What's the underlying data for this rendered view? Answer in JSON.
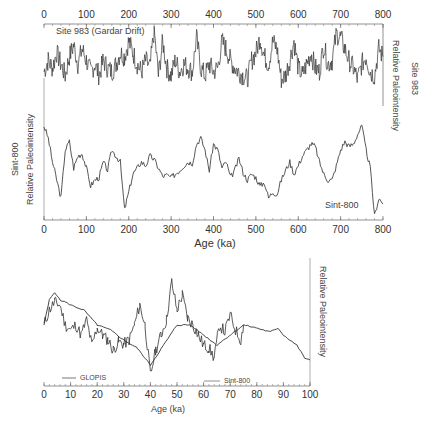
{
  "chart_data": [
    {
      "type": "line",
      "title": "Site 983 (Gardar Drift)",
      "xlabel": "Age (ka)",
      "top_axis": {
        "ticks": [
          0,
          100,
          200,
          300,
          400,
          500,
          600,
          700,
          800
        ],
        "labels": [
          "0",
          "100",
          "200",
          "300",
          "400",
          "500",
          "600",
          "700",
          "800"
        ]
      },
      "bottom_axis": {
        "ticks": [
          0,
          100,
          200,
          300,
          400,
          500,
          600,
          700,
          800
        ],
        "labels": [
          "0",
          "100",
          "200",
          "300",
          "400",
          "500",
          "600",
          "700",
          "800"
        ]
      },
      "xlim": [
        0,
        800
      ],
      "right_ylabel_1": "Relative Paleointensity",
      "right_ylabel_2": "Site 983",
      "left_ylabel_1": "Sint-800",
      "left_ylabel_2": "Relative Paleointensity",
      "grid": false,
      "series": [
        {
          "name": "Site 983",
          "note": "high-frequency relative paleointensity record, upper trace",
          "x": [
            0,
            10,
            20,
            30,
            40,
            50,
            60,
            70,
            80,
            90,
            100,
            110,
            120,
            130,
            140,
            150,
            160,
            170,
            180,
            190,
            200,
            210,
            220,
            230,
            240,
            250,
            260,
            270,
            280,
            290,
            300,
            310,
            320,
            330,
            340,
            350,
            360,
            370,
            380,
            390,
            400,
            410,
            420,
            430,
            440,
            450,
            460,
            470,
            480,
            490,
            500,
            510,
            520,
            530,
            540,
            550,
            560,
            570,
            580,
            590,
            600,
            610,
            620,
            630,
            640,
            650,
            660,
            670,
            680,
            690,
            700,
            710,
            720,
            730,
            740,
            750,
            760,
            770,
            780,
            790,
            800
          ],
          "y": [
            0.45,
            0.6,
            0.5,
            0.7,
            0.55,
            0.4,
            0.65,
            0.8,
            0.55,
            0.75,
            0.6,
            0.45,
            0.55,
            0.4,
            0.6,
            0.5,
            0.45,
            0.55,
            0.7,
            0.65,
            0.85,
            0.7,
            0.55,
            0.45,
            0.6,
            0.5,
            1.0,
            0.4,
            0.85,
            0.5,
            0.4,
            0.6,
            0.45,
            0.55,
            0.5,
            0.45,
            0.9,
            0.5,
            0.4,
            0.55,
            0.45,
            0.5,
            0.85,
            0.75,
            0.6,
            0.5,
            0.45,
            0.4,
            0.35,
            0.6,
            0.7,
            0.9,
            0.65,
            0.55,
            0.85,
            0.75,
            0.35,
            0.4,
            0.6,
            0.85,
            0.5,
            0.4,
            0.55,
            0.7,
            0.5,
            0.45,
            0.8,
            0.55,
            0.6,
            0.95,
            0.9,
            0.75,
            0.6,
            0.5,
            0.35,
            0.55,
            0.65,
            0.45,
            0.4,
            0.75,
            0.65
          ]
        },
        {
          "name": "Sint-800",
          "note": "smoothed stack, lower trace",
          "x": [
            0,
            10,
            20,
            30,
            40,
            50,
            60,
            70,
            80,
            90,
            100,
            110,
            120,
            130,
            140,
            150,
            160,
            170,
            180,
            190,
            200,
            210,
            220,
            230,
            240,
            250,
            260,
            270,
            280,
            290,
            300,
            310,
            320,
            330,
            340,
            350,
            360,
            370,
            380,
            390,
            400,
            410,
            420,
            430,
            440,
            450,
            460,
            470,
            480,
            490,
            500,
            510,
            520,
            530,
            540,
            550,
            560,
            570,
            580,
            590,
            600,
            610,
            620,
            630,
            640,
            650,
            660,
            670,
            680,
            690,
            700,
            710,
            720,
            730,
            740,
            750,
            760,
            770,
            780,
            790,
            800
          ],
          "y": [
            0.75,
            0.65,
            0.45,
            0.3,
            0.15,
            0.55,
            0.62,
            0.4,
            0.5,
            0.52,
            0.4,
            0.25,
            0.3,
            0.32,
            0.45,
            0.38,
            0.55,
            0.5,
            0.45,
            0.05,
            0.2,
            0.35,
            0.4,
            0.45,
            0.42,
            0.5,
            0.47,
            0.4,
            0.33,
            0.34,
            0.32,
            0.35,
            0.38,
            0.42,
            0.45,
            0.44,
            0.6,
            0.65,
            0.55,
            0.38,
            0.6,
            0.55,
            0.4,
            0.45,
            0.32,
            0.38,
            0.48,
            0.36,
            0.3,
            0.35,
            0.32,
            0.25,
            0.28,
            0.15,
            0.2,
            0.18,
            0.3,
            0.38,
            0.45,
            0.35,
            0.42,
            0.5,
            0.55,
            0.6,
            0.58,
            0.45,
            0.35,
            0.3,
            0.3,
            0.42,
            0.55,
            0.62,
            0.58,
            0.6,
            0.68,
            0.75,
            0.55,
            0.4,
            0.0,
            0.15,
            0.1
          ]
        }
      ],
      "annotations": [
        "Site 983 (Gardar Drift)",
        "Sint-800"
      ]
    },
    {
      "type": "line",
      "xlabel": "Age (ka)",
      "xlim": [
        0,
        100
      ],
      "bottom_axis": {
        "ticks": [
          0,
          10,
          20,
          30,
          40,
          50,
          60,
          70,
          80,
          90,
          100
        ],
        "labels": [
          "0",
          "10",
          "20",
          "30",
          "40",
          "50",
          "60",
          "70",
          "80",
          "90",
          "100"
        ]
      },
      "right_ylabel": "Relative Paleointensity",
      "grid": false,
      "legend": [
        "GLOPIS",
        "Sint-800"
      ],
      "legend_position": "bottom-inside",
      "series": [
        {
          "name": "GLOPIS",
          "note": "high-resolution record 0-75 ka",
          "x": [
            0,
            2,
            4,
            6,
            8,
            10,
            12,
            14,
            16,
            18,
            20,
            22,
            24,
            26,
            28,
            30,
            32,
            34,
            36,
            38,
            40,
            42,
            44,
            46,
            48,
            50,
            52,
            54,
            56,
            58,
            60,
            62,
            64,
            66,
            68,
            70,
            72,
            74,
            75
          ],
          "y": [
            0.55,
            0.7,
            0.78,
            0.75,
            0.55,
            0.5,
            0.55,
            0.45,
            0.6,
            0.35,
            0.52,
            0.45,
            0.4,
            0.3,
            0.38,
            0.36,
            0.4,
            0.55,
            0.75,
            0.55,
            0.05,
            0.3,
            0.45,
            0.6,
            0.98,
            0.7,
            0.85,
            0.62,
            0.55,
            0.45,
            0.35,
            0.32,
            0.22,
            0.55,
            0.48,
            0.65,
            0.5,
            0.4,
            0.55
          ]
        },
        {
          "name": "Sint-800",
          "note": "smooth trace 0-100 ka",
          "x": [
            0,
            2,
            4,
            6,
            8,
            10,
            15,
            20,
            25,
            30,
            35,
            40,
            45,
            50,
            55,
            60,
            65,
            70,
            75,
            80,
            85,
            88,
            90,
            95,
            98,
            100
          ],
          "y": [
            0.55,
            0.8,
            0.88,
            0.8,
            0.78,
            0.75,
            0.7,
            0.55,
            0.5,
            0.4,
            0.32,
            0.15,
            0.35,
            0.55,
            0.55,
            0.45,
            0.35,
            0.45,
            0.55,
            0.52,
            0.48,
            0.52,
            0.45,
            0.35,
            0.22,
            0.2
          ]
        }
      ]
    }
  ],
  "labels": {
    "top_title": "Site 983 (Gardar Drift)",
    "top_right_label_1": "Relative Paleointensity",
    "top_right_label_2": "Site 983",
    "left_label_1": "Sint-800",
    "left_label_2": "Relative Paleointensity",
    "sint_annotation": "Sint-800",
    "top_xlabel": "Age (ka)",
    "bottom_right_label": "Relative Paleointensity",
    "bottom_xlabel": "Age (ka)",
    "legend_glopis": "GLOPIS",
    "legend_sint": "Sint-800"
  }
}
